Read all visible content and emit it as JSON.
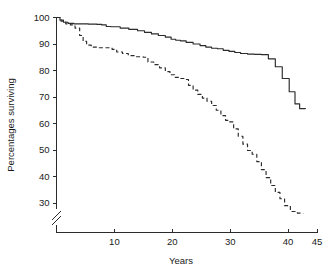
{
  "chart_data": {
    "type": "line",
    "title": "",
    "subtitle": "",
    "xlabel": "Years",
    "ylabel": "Percentages surviving",
    "xlim": [
      0,
      45
    ],
    "ylim": [
      25,
      100
    ],
    "y_axis_break": true,
    "y_axis_break_below": 30,
    "grid": false,
    "legend": "none",
    "xticks": [
      10,
      20,
      30,
      40,
      45
    ],
    "xtick_labels": [
      "10",
      "20",
      "30",
      "40",
      "45"
    ],
    "yticks": [
      30,
      40,
      50,
      60,
      70,
      80,
      90,
      100
    ],
    "ytick_labels": [
      "30",
      "40",
      "50",
      "60",
      "70",
      "80",
      "90",
      "100"
    ],
    "series": [
      {
        "name": "solid-curve",
        "style": "solid",
        "color": "#2b2b2b",
        "step": true,
        "x": [
          0,
          0.6,
          1.2,
          2.0,
          3.0,
          4.2,
          5.5,
          7.0,
          7.8,
          8.6,
          9.4,
          11.0,
          12.5,
          14.0,
          15.2,
          16.4,
          17.6,
          18.8,
          19.8,
          20.6,
          21.4,
          22.4,
          23.6,
          24.8,
          25.8,
          26.8,
          27.8,
          28.8,
          29.8,
          30.8,
          31.8,
          33.0,
          34.2,
          35.4,
          36.6,
          37.8,
          39.0,
          40.2,
          41.2,
          42.0,
          43.0
        ],
        "y": [
          100.0,
          99.0,
          98.2,
          97.8,
          97.6,
          97.6,
          97.5,
          97.4,
          97.2,
          96.6,
          96.5,
          96.0,
          95.5,
          95.0,
          94.4,
          93.8,
          93.2,
          92.6,
          91.8,
          91.4,
          91.2,
          90.6,
          90.0,
          89.4,
          88.8,
          88.4,
          88.2,
          87.6,
          87.2,
          86.8,
          86.4,
          86.2,
          86.1,
          86.0,
          84.4,
          81.4,
          77.0,
          72.0,
          67.4,
          65.6,
          65.5
        ]
      },
      {
        "name": "dashed-curve",
        "style": "dashed",
        "color": "#2b2b2b",
        "step": true,
        "x": [
          0,
          0.8,
          1.6,
          2.4,
          3.2,
          4.0,
          4.6,
          5.2,
          6.0,
          7.0,
          8.0,
          9.0,
          9.6,
          10.4,
          11.4,
          12.4,
          13.4,
          14.4,
          15.0,
          15.8,
          16.8,
          17.8,
          18.8,
          19.6,
          20.4,
          21.2,
          22.0,
          22.8,
          23.6,
          24.4,
          25.2,
          26.0,
          26.8,
          27.6,
          28.4,
          29.2,
          29.8,
          30.6,
          31.4,
          32.2,
          33.0,
          33.8,
          34.6,
          35.4,
          36.2,
          37.0,
          37.8,
          38.6,
          39.4,
          40.4,
          41.6,
          42.6
        ],
        "y": [
          100.0,
          98.6,
          97.6,
          97.2,
          96.0,
          93.2,
          91.0,
          89.6,
          88.8,
          88.6,
          88.6,
          88.6,
          88.0,
          87.0,
          86.4,
          85.6,
          85.2,
          85.2,
          85.0,
          83.2,
          82.2,
          81.0,
          79.6,
          78.4,
          77.4,
          77.0,
          76.6,
          74.4,
          72.6,
          71.0,
          69.6,
          68.4,
          66.8,
          65.0,
          63.0,
          61.2,
          60.6,
          58.0,
          55.2,
          52.2,
          49.8,
          48.4,
          45.6,
          42.6,
          39.6,
          36.6,
          34.0,
          31.6,
          29.0,
          26.8,
          26.2,
          26.1
        ]
      }
    ]
  },
  "axes": {
    "x_label": "Years",
    "y_label": "Percentages surviving"
  },
  "colors": {
    "ink": "#2b2b2b",
    "background": "#ffffff"
  }
}
